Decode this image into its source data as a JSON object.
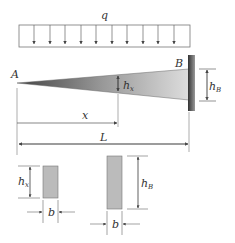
{
  "labels": {
    "load": "q",
    "end_a": "A",
    "end_b": "B",
    "height_x_main": "h",
    "height_x_sub": "x",
    "height_b_main": "h",
    "height_b_sub": "B",
    "dist_x": "x",
    "length": "L",
    "section1_h_main": "h",
    "section1_h_sub": "x",
    "section1_b": "b",
    "section2_h_main": "h",
    "section2_h_sub": "B",
    "section2_b": "b"
  },
  "colors": {
    "line": "#555555",
    "beam_dark": "#555555",
    "beam_light": "#dddddd",
    "wall": "#666666",
    "section_fill": "#bbbbbb"
  }
}
